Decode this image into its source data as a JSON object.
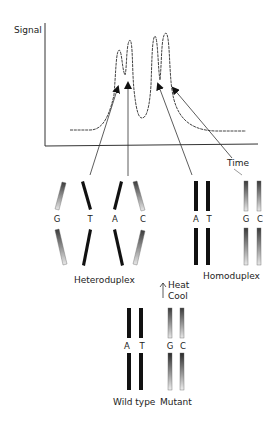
{
  "chart": {
    "y_axis_label": "Signal",
    "x_axis_label": "Time",
    "peaks": [
      "heteroduplex-GT-peak",
      "heteroduplex-AC-peak",
      "homoduplex-AT-peak",
      "homoduplex-GC-peak"
    ]
  },
  "heteroduplex": {
    "label": "Heteroduplex",
    "bases": [
      "G",
      "T",
      "A",
      "C"
    ]
  },
  "homoduplex": {
    "label": "Homoduplex",
    "wildtype_bases": [
      "A",
      "T"
    ],
    "mutant_bases": [
      "G",
      "C"
    ]
  },
  "process": {
    "heat_label": "Heat",
    "cool_label": "Cool"
  },
  "source": {
    "wildtype_label": "Wild type",
    "mutant_label": "Mutant",
    "wildtype_bases": [
      "A",
      "T"
    ],
    "mutant_bases": [
      "G",
      "C"
    ]
  },
  "colors": {
    "dark_strand": "#111111",
    "mutant_strand_dark": "#3a3a3a",
    "mutant_strand_light": "#e8e8e8",
    "line": "#333333"
  }
}
